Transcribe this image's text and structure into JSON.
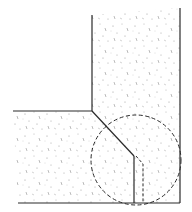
{
  "diagram": {
    "type": "section-detail",
    "colors": {
      "background": "#ffffff",
      "line": "#2a2a2a",
      "stipple": "#9a9a9a"
    },
    "elements": {
      "vertical_wall": {
        "x_left": 92,
        "x_right": 180,
        "y_top_left": 15,
        "y_top_right": 8
      },
      "horizontal_slab": {
        "y_top": 111,
        "x_left": 13,
        "y_bottom": 203
      },
      "chamfer": {
        "from": [
          92,
          111
        ],
        "to": [
          134,
          156
        ]
      },
      "solid_vertical": {
        "x": 134,
        "y_from": 156,
        "y_to": 203
      },
      "dashed_outline": {
        "points": [
          [
            136,
            156
          ],
          [
            143,
            164
          ],
          [
            143,
            203
          ]
        ]
      },
      "detail_circle": {
        "cx": 136,
        "cy": 160,
        "r": 45
      }
    }
  }
}
